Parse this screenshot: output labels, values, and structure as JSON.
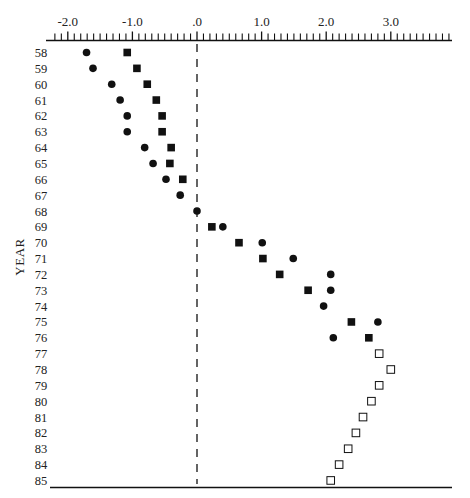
{
  "chart_data": {
    "type": "scatter",
    "title": "",
    "xlabel": "",
    "ylabel": "YEAR",
    "xlim": [
      -2.2,
      4.0
    ],
    "x_ticks": [
      -2.0,
      -1.0,
      0.0,
      1.0,
      2.0,
      3.0
    ],
    "x_tick_labels": [
      "-2.0",
      "-1.0",
      ".0",
      "1.0",
      "2.0",
      "3.0"
    ],
    "x_minor_step": 0.1,
    "x_axis_position": "top",
    "reference_line": {
      "x": 0.0,
      "style": "dashed"
    },
    "grid": false,
    "legend": null,
    "categories": [
      "58",
      "59",
      "60",
      "61",
      "62",
      "63",
      "64",
      "65",
      "66",
      "67",
      "68",
      "69",
      "70",
      "71",
      "72",
      "73",
      "74",
      "75",
      "76",
      "77",
      "78",
      "79",
      "80",
      "81",
      "82",
      "83",
      "84",
      "85"
    ],
    "series": [
      {
        "name": "filled-circle",
        "marker": "circle",
        "fill": "#111111",
        "points": [
          {
            "year": "58",
            "x": -1.71
          },
          {
            "year": "59",
            "x": -1.61
          },
          {
            "year": "60",
            "x": -1.32
          },
          {
            "year": "61",
            "x": -1.19
          },
          {
            "year": "62",
            "x": -1.08
          },
          {
            "year": "63",
            "x": -1.08
          },
          {
            "year": "64",
            "x": -0.81
          },
          {
            "year": "65",
            "x": -0.68
          },
          {
            "year": "66",
            "x": -0.48
          },
          {
            "year": "67",
            "x": -0.26
          },
          {
            "year": "68",
            "x": 0.0
          },
          {
            "year": "69",
            "x": 0.4
          },
          {
            "year": "70",
            "x": 1.01
          },
          {
            "year": "71",
            "x": 1.49
          },
          {
            "year": "72",
            "x": 2.07
          },
          {
            "year": "73",
            "x": 2.07
          },
          {
            "year": "74",
            "x": 1.96
          },
          {
            "year": "75",
            "x": 2.8
          },
          {
            "year": "76",
            "x": 2.11
          }
        ]
      },
      {
        "name": "filled-square",
        "marker": "square",
        "fill": "#111111",
        "points": [
          {
            "year": "58",
            "x": -1.08
          },
          {
            "year": "59",
            "x": -0.93
          },
          {
            "year": "60",
            "x": -0.77
          },
          {
            "year": "61",
            "x": -0.63
          },
          {
            "year": "62",
            "x": -0.54
          },
          {
            "year": "63",
            "x": -0.54
          },
          {
            "year": "64",
            "x": -0.4
          },
          {
            "year": "65",
            "x": -0.42
          },
          {
            "year": "66",
            "x": -0.22
          },
          {
            "year": "69",
            "x": 0.23
          },
          {
            "year": "70",
            "x": 0.65
          },
          {
            "year": "71",
            "x": 1.02
          },
          {
            "year": "72",
            "x": 1.28
          },
          {
            "year": "73",
            "x": 1.72
          },
          {
            "year": "75",
            "x": 2.39
          },
          {
            "year": "76",
            "x": 2.66
          }
        ]
      },
      {
        "name": "open-square",
        "marker": "square-open",
        "fill": "none",
        "points": [
          {
            "year": "77",
            "x": 2.82
          },
          {
            "year": "78",
            "x": 3.0
          },
          {
            "year": "79",
            "x": 2.82
          },
          {
            "year": "80",
            "x": 2.7
          },
          {
            "year": "81",
            "x": 2.57
          },
          {
            "year": "82",
            "x": 2.46
          },
          {
            "year": "83",
            "x": 2.34
          },
          {
            "year": "84",
            "x": 2.2
          },
          {
            "year": "85",
            "x": 2.07
          }
        ]
      }
    ]
  },
  "colors": {
    "ink": "#111111",
    "background": "#ffffff"
  }
}
